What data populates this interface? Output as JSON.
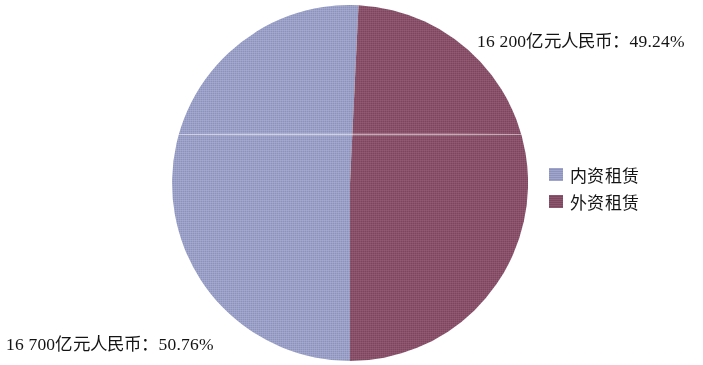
{
  "chart_data": {
    "type": "pie",
    "title": "",
    "subtitle": "",
    "xlabel": "",
    "ylabel": "",
    "grid": false,
    "legend_position": "right",
    "unit": "亿元人民币",
    "categories": [
      "内资租赁",
      "外资租赁"
    ],
    "values": [
      16700,
      16200
    ],
    "percentages": [
      50.76,
      49.24
    ],
    "colors": [
      "#8f95c0",
      "#7c4a60"
    ],
    "start_angle_deg": 180,
    "direction": "clockwise",
    "slices": [
      {
        "name": "内资租赁",
        "value": 16700,
        "percent": 50.76,
        "color": "#8f95c0",
        "label": "16 700亿元人民币：50.76%"
      },
      {
        "name": "外资租赁",
        "value": 16200,
        "percent": 49.24,
        "color": "#7c4a60",
        "label": "16 200亿元人民币：49.24%"
      }
    ],
    "annotations": [
      "16 200亿元人民币：49.24%",
      "16 700亿元人民币：50.76%"
    ]
  },
  "labels": {
    "foreign_callout": "16 200亿元人民币：49.24%",
    "domestic_callout": "16 700亿元人民币：50.76%"
  },
  "legend": {
    "items": [
      {
        "label": "内资租赁",
        "color": "#8f95c0"
      },
      {
        "label": "外资租赁",
        "color": "#7c4a60"
      }
    ]
  },
  "palette": {
    "domestic": "#8f95c0",
    "foreign": "#7c4a60",
    "background": "#ffffff",
    "text": "#141414"
  }
}
